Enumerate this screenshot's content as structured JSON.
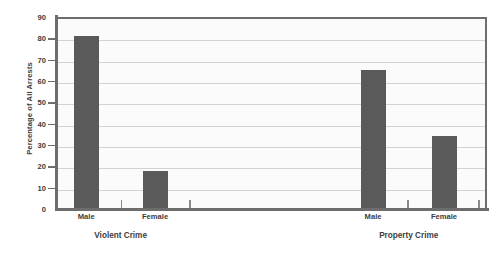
{
  "chart_data": {
    "type": "bar",
    "title": "",
    "xlabel": "",
    "ylabel": "Percentage of All Arrests",
    "ylim": [
      0,
      90
    ],
    "ytick_step": 10,
    "yticks": [
      0,
      10,
      20,
      30,
      40,
      50,
      60,
      70,
      80,
      90
    ],
    "grid": true,
    "legend": "none",
    "categories": [
      "Male",
      "Female",
      "Male",
      "Female"
    ],
    "values": [
      81,
      18,
      65,
      34
    ],
    "groups": [
      {
        "label": "Violent Crime",
        "categories": [
          "Male",
          "Female"
        ],
        "values": [
          81,
          18
        ]
      },
      {
        "label": "Property Crime",
        "categories": [
          "Male",
          "Female"
        ],
        "values": [
          65,
          34
        ]
      }
    ],
    "series": [
      {
        "name": "Percentage of All Arrests",
        "values": [
          81,
          18,
          65,
          34
        ]
      }
    ],
    "bar_color": "#5a5a5a",
    "plot_background": "#fbfbfb",
    "gridline_color": "#d2d2d2",
    "axis_color": "#6d6d6d"
  }
}
